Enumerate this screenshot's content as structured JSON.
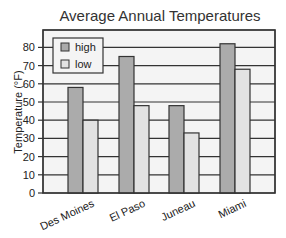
{
  "chart_data": {
    "type": "bar",
    "title": "Average Annual Temperatures",
    "xlabel": "",
    "ylabel": "Temperature (°F)",
    "categories": [
      "Des Moines",
      "El Paso",
      "Juneau",
      "Miami"
    ],
    "series": [
      {
        "name": "high",
        "values": [
          58,
          75,
          48,
          82
        ],
        "color": "#ababab"
      },
      {
        "name": "low",
        "values": [
          40,
          48,
          33,
          68
        ],
        "color": "#e2e2e2"
      }
    ],
    "yticks": [
      0,
      10,
      20,
      30,
      40,
      50,
      60,
      70,
      80
    ],
    "ylim": [
      0,
      88
    ],
    "grid": true,
    "legend_position": "upper left"
  },
  "colors": {
    "plot_bg": "#f4f4f4",
    "grid": "#333333",
    "bar_outline": "#333333"
  }
}
